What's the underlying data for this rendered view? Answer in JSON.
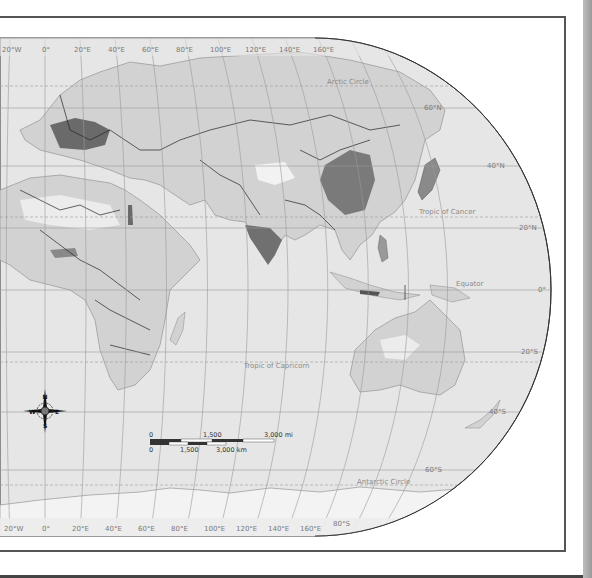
{
  "map": {
    "title": "World population density (Eastern Hemisphere)",
    "colors": {
      "ocean": "#e6e6e6",
      "land": "#d2d2d2",
      "dense_1": "#a8a8a8",
      "dense_2": "#808080",
      "dense_3": "#5e5e5e",
      "sparse": "#f2f2f2",
      "border": "#222222",
      "graticule": "#9a9a9a"
    },
    "top_longitude_labels": [
      "20°W",
      "0°",
      "20°E",
      "40°E",
      "60°E",
      "80°E",
      "100°E",
      "120°E",
      "140°E",
      "160°E"
    ],
    "bottom_longitude_labels": [
      "20°W",
      "0°",
      "20°E",
      "40°E",
      "60°E",
      "80°E",
      "100°E",
      "120°E",
      "140°E",
      "160°E"
    ],
    "latitude_labels": [
      "60°N",
      "40°N",
      "20°N",
      "0°",
      "20°S",
      "40°S",
      "60°S",
      "80°S"
    ],
    "special_lines": {
      "arctic_circle": "Arctic Circle",
      "tropic_cancer": "Tropic of Cancer",
      "equator": "Equator",
      "tropic_capricorn": "Tropic of Capricorn",
      "antarctic_circle": "Antarctic Circle"
    },
    "compass": {
      "n": "N",
      "s": "S",
      "e": "E",
      "w": "W"
    },
    "scale_bar": {
      "mi_labels": [
        "0",
        "1,500",
        "3,000 mi"
      ],
      "km_labels": [
        "0",
        "1,500",
        "3,000 km"
      ]
    }
  }
}
